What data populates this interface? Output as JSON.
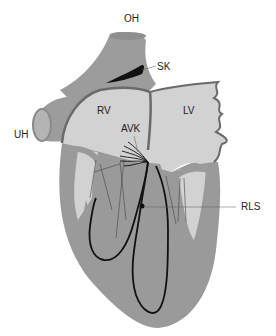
{
  "diagram": {
    "labels": {
      "oh": "OH",
      "sk": "SK",
      "rv": "RV",
      "lv": "LV",
      "avk": "AVK",
      "uh": "UH",
      "rls": "RLS"
    },
    "colors": {
      "background": "#ffffff",
      "muscle_dark": "#9a9a9a",
      "chamber_light": "#d2d2d2",
      "vessel": "#9c9c9c",
      "vessel_lumen": "#b4b4b4",
      "septum_line": "#6a6a6a",
      "conduction_black": "#111111",
      "leader_line": "#555555"
    }
  }
}
